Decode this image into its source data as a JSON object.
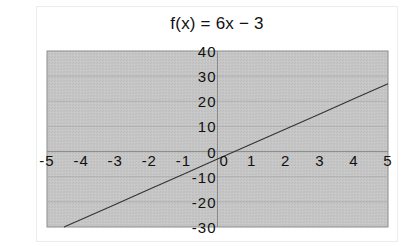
{
  "chart_data": {
    "type": "line",
    "title": "f(x) = 6x − 3",
    "xlabel": "",
    "ylabel": "",
    "xlim": [
      -5,
      5
    ],
    "ylim": [
      -30,
      40
    ],
    "x_ticks": [
      -5,
      -4,
      -3,
      -2,
      -1,
      0,
      1,
      2,
      3,
      4,
      5
    ],
    "y_ticks": [
      40,
      30,
      20,
      10,
      0,
      -10,
      -20,
      -30
    ],
    "x_tick_labels": [
      "-5",
      "-4",
      "-3",
      "-2",
      "-1",
      "0",
      "1",
      "2",
      "3",
      "4",
      "5"
    ],
    "y_tick_labels": [
      "40",
      "30",
      "20",
      "10",
      "0",
      "-10",
      "-20",
      "-30"
    ],
    "grid": {
      "horizontal": true,
      "vertical": false
    },
    "legend": null,
    "series": [
      {
        "name": "f(x) = 6x − 3",
        "x": [
          -4.5,
          -4,
          -3,
          -2,
          -1,
          0,
          1,
          2,
          3,
          4,
          5
        ],
        "y": [
          -30,
          -27,
          -21,
          -15,
          -9,
          -3,
          3,
          9,
          15,
          21,
          27
        ]
      }
    ]
  },
  "colors": {
    "plot_background": "#c4c4c4",
    "gridline": "#b0b0b0",
    "axis": "#8a8a8a",
    "plot_border": "#8c8c8c",
    "series_line": "#333333",
    "frame_border": "#ececec"
  }
}
